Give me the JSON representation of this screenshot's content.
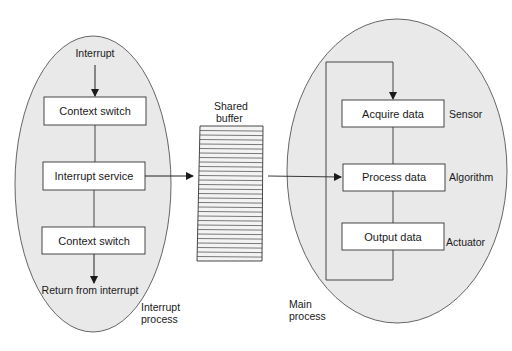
{
  "diagram": {
    "colors": {
      "ellipse_fill": "#e9e9e9",
      "stroke": "#333333",
      "box_fill": "#ffffff",
      "buffer_fill": "#f3f3f3"
    },
    "interrupt_process": {
      "label_line1": "Interrupt",
      "label_line2": "process",
      "entry_label": "Interrupt",
      "exit_label": "Return from interrupt",
      "steps": [
        {
          "label": "Context switch"
        },
        {
          "label": "Interrupt service"
        },
        {
          "label": "Context switch"
        }
      ]
    },
    "shared_buffer": {
      "label_line1": "Shared",
      "label_line2": "buffer",
      "slot_count": 30
    },
    "main_process": {
      "label_line1": "Main",
      "label_line2": "process",
      "steps": [
        {
          "label": "Acquire data",
          "annotation": "Sensor"
        },
        {
          "label": "Process data",
          "annotation": "Algorithm"
        },
        {
          "label": "Output data",
          "annotation": "Actuator"
        }
      ]
    }
  }
}
